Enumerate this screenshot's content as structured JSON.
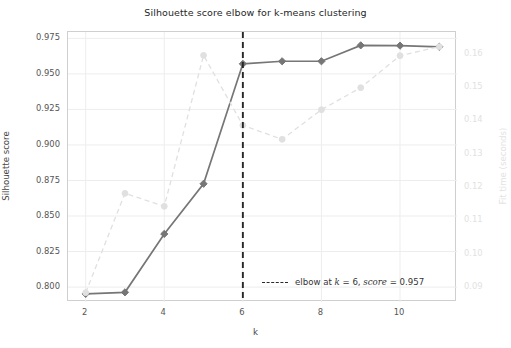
{
  "chart_data": {
    "type": "line",
    "title": "Silhouette score elbow for k-means clustering",
    "xlabel": "k",
    "ylabel": "Silhouette score",
    "ylabel_right": "Fit time (seconds)",
    "x": [
      2,
      3,
      4,
      5,
      6,
      7,
      8,
      9,
      10,
      11
    ],
    "xlim": [
      1.55,
      11.45
    ],
    "xticks": [
      2,
      4,
      6,
      8,
      10
    ],
    "xticklabels": [
      "2",
      "4",
      "6",
      "8",
      "10"
    ],
    "ylim": [
      0.7895,
      0.9795
    ],
    "yticks": [
      0.8,
      0.825,
      0.85,
      0.875,
      0.9,
      0.925,
      0.95,
      0.975
    ],
    "yticklabels": [
      "0.800",
      "0.825",
      "0.850",
      "0.875",
      "0.900",
      "0.925",
      "0.950",
      "0.975"
    ],
    "ylim_right": [
      0.0855,
      0.1665
    ],
    "yticks_right": [
      0.09,
      0.1,
      0.11,
      0.12,
      0.13,
      0.14,
      0.15,
      0.16
    ],
    "yticklabels_right": [
      "0.09",
      "0.10",
      "0.11",
      "0.12",
      "0.13",
      "0.14",
      "0.15",
      "0.16"
    ],
    "grid": true,
    "legend_position": "lower right",
    "series": [
      {
        "name": "silhouette score",
        "axis": "left",
        "style": "solid",
        "color": "#767676",
        "marker": "diamond",
        "values": [
          0.7952,
          0.7963,
          0.8374,
          0.8727,
          0.9571,
          0.9589,
          0.9589,
          0.9701,
          0.9699,
          0.9691
        ]
      },
      {
        "name": "fit time",
        "axis": "right",
        "style": "dashed",
        "color": "#e0e0e0",
        "marker": "circle",
        "values": [
          0.0883,
          0.1181,
          0.1142,
          0.1595,
          0.1385,
          0.1343,
          0.1432,
          0.1498,
          0.1594,
          0.1621
        ]
      }
    ],
    "annotations": [
      {
        "name": "elbow-line",
        "type": "vline",
        "x": 6,
        "style": "dashed",
        "color": "#262626"
      }
    ],
    "legend": [
      {
        "marker": "dashed-line",
        "text_plain": "elbow at k = 6, score = 0.957",
        "parts": [
          {
            "text": "elbow at ",
            "italic": false
          },
          {
            "text": "k",
            "italic": true
          },
          {
            "text": " = 6, ",
            "italic": false
          },
          {
            "text": "score",
            "italic": true
          },
          {
            "text": " = 0.957",
            "italic": false
          }
        ]
      }
    ],
    "colors": {
      "background": "#ffffff",
      "grid": "#ededed",
      "frame": "#cfcfcf",
      "tick_label": "#555555",
      "tick_label_right": "#e2e2e2",
      "title": "#262626"
    }
  }
}
